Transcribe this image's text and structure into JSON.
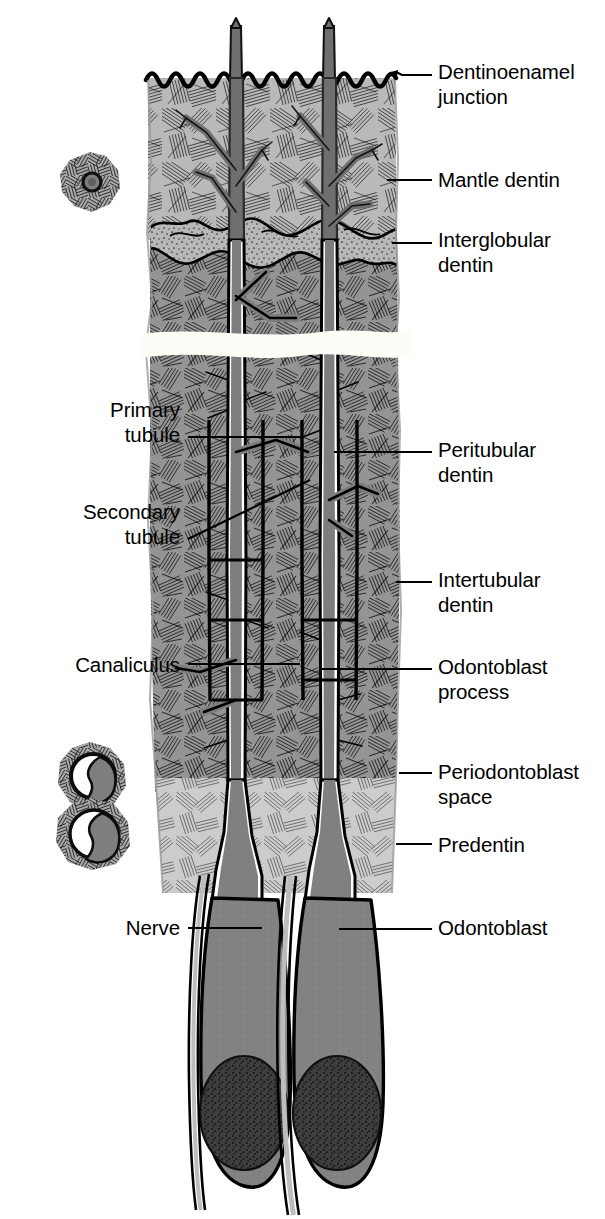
{
  "figure": {
    "colors": {
      "background": "#ffffff",
      "ink": "#000000",
      "mantle_dentin_fill": "#b4b4b4",
      "circumpulpal_dentin_fill": "#8c8c8c",
      "predentin_fill": "#c9c9c9",
      "odontoblast_process_fill": "#7d7d7d",
      "odontoblast_body_fill": "#808080",
      "nucleus_fill": "#3a3a3a",
      "periodontoblast_space": "#ffffff",
      "break_band": "#fbfbf6"
    }
  },
  "labels": {
    "right": [
      {
        "id": "dentinoenamel-junction",
        "text": "Dentinoenamel\njunction",
        "x": 438,
        "y": 60,
        "leader": {
          "x1": 396,
          "y1": 75,
          "x2": 432,
          "y2": 75
        },
        "arrow": true
      },
      {
        "id": "mantle-dentin",
        "text": "Mantle dentin",
        "x": 438,
        "y": 168,
        "leader": {
          "x1": 387,
          "y1": 180,
          "x2": 432,
          "y2": 180
        },
        "arrow": false
      },
      {
        "id": "interglobular-dentin",
        "text": "Interglobular\ndentin",
        "x": 438,
        "y": 228,
        "leader": {
          "x1": 392,
          "y1": 243,
          "x2": 432,
          "y2": 243
        },
        "arrow": false
      },
      {
        "id": "peritubular-dentin",
        "text": "Peritubular\ndentin",
        "x": 438,
        "y": 438,
        "leader": {
          "x1": 334,
          "y1": 452,
          "x2": 432,
          "y2": 452
        },
        "arrow": false
      },
      {
        "id": "intertubular-dentin",
        "text": "Intertubular\ndentin",
        "x": 438,
        "y": 568,
        "leader": {
          "x1": 396,
          "y1": 582,
          "x2": 432,
          "y2": 582
        },
        "arrow": false
      },
      {
        "id": "odontoblast-process",
        "text": "Odontoblast\nprocess",
        "x": 438,
        "y": 655,
        "leader": {
          "x1": 322,
          "y1": 669,
          "x2": 432,
          "y2": 669
        },
        "arrow": false
      },
      {
        "id": "periodontoblast-space",
        "text": "Periodontoblast\nspace",
        "x": 438,
        "y": 760,
        "leader": {
          "x1": 399,
          "y1": 773,
          "x2": 432,
          "y2": 773
        },
        "arrow": false
      },
      {
        "id": "predentin",
        "text": "Predentin",
        "x": 438,
        "y": 833,
        "leader": {
          "x1": 396,
          "y1": 844,
          "x2": 432,
          "y2": 844
        },
        "arrow": false
      },
      {
        "id": "odontoblast",
        "text": "Odontoblast",
        "x": 438,
        "y": 916,
        "leader": {
          "x1": 339,
          "y1": 929,
          "x2": 432,
          "y2": 929
        },
        "arrow": false
      }
    ],
    "left": [
      {
        "id": "primary-tubule",
        "text": "Primary\ntubule",
        "x": 40,
        "y": 398,
        "width": 140,
        "leader": {
          "x1": 188,
          "y1": 437,
          "x2": 300,
          "y2": 437
        },
        "diagonal": false
      },
      {
        "id": "secondary-tubule",
        "text": "Secondary\ntubule",
        "x": 20,
        "y": 500,
        "width": 160,
        "leader": {
          "x1": 188,
          "y1": 539,
          "x2": 310,
          "y2": 480
        },
        "diagonal": true
      },
      {
        "id": "canaliculus",
        "text": "Canaliculus",
        "x": 10,
        "y": 653,
        "width": 170,
        "leader": {
          "x1": 188,
          "y1": 664,
          "x2": 300,
          "y2": 664
        },
        "diagonal": false
      },
      {
        "id": "nerve",
        "text": "Nerve",
        "x": 40,
        "y": 916,
        "width": 140,
        "leader": {
          "x1": 188,
          "y1": 928,
          "x2": 262,
          "y2": 928
        },
        "diagonal": false
      }
    ]
  },
  "insets": [
    {
      "id": "inset-tubule-cross-section",
      "cx": 90,
      "cy": 182,
      "r": 30,
      "note": "tubule cross section with radiating intertubular fibers"
    },
    {
      "id": "inset-process-cross-section-upper",
      "cx": 90,
      "cy": 775,
      "r": 34,
      "note": "odontoblast process with periodontoblast space"
    },
    {
      "id": "inset-process-cross-section-lower",
      "cx": 92,
      "cy": 833,
      "r": 36,
      "note": "odontoblast process with periodontoblast space"
    }
  ],
  "regions": [
    {
      "id": "mantle-dentin-zone",
      "y_top": 78,
      "y_bottom": 232
    },
    {
      "id": "interglobular-dentin-zone",
      "y_top": 232,
      "y_bottom": 262
    },
    {
      "id": "circumpulpal-dentin-zone",
      "y_top": 262,
      "y_bottom": 790
    },
    {
      "id": "section-break-band",
      "y_top": 330,
      "y_bottom": 352
    },
    {
      "id": "predentin-zone",
      "y_top": 790,
      "y_bottom": 893
    },
    {
      "id": "odontoblast-layer",
      "y_top": 893,
      "y_bottom": 1200
    }
  ],
  "tubules": [
    {
      "id": "tubule-left",
      "x": 236
    },
    {
      "id": "tubule-right",
      "x": 329
    }
  ]
}
